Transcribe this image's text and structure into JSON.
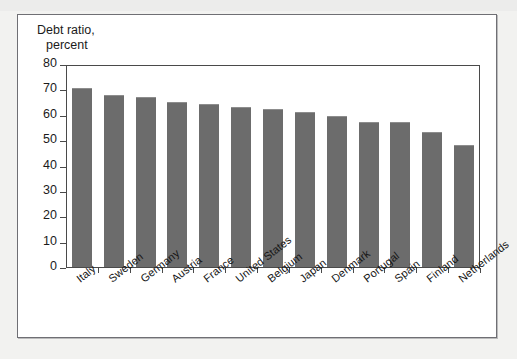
{
  "figure": {
    "title_line1": "Debt ratio,",
    "title_line2": "percent",
    "bar_color": "#6c6c6c",
    "panel_background": "#ffffff",
    "page_background": "#f2f2f0",
    "frame_color": "#6f6f74"
  },
  "chart_data": {
    "type": "bar",
    "title": "Debt ratio, percent",
    "xlabel": "",
    "ylabel": "Debt ratio, percent",
    "ylim": [
      0,
      80
    ],
    "yticks": [
      0,
      10,
      20,
      30,
      40,
      50,
      60,
      70,
      80
    ],
    "ytick_labels": [
      "0",
      "10",
      "20",
      "30",
      "40",
      "50",
      "60",
      "70",
      "80"
    ],
    "grid": false,
    "legend": null,
    "categories": [
      "Italy",
      "Sweden",
      "Germany",
      "Austria",
      "France",
      "United States",
      "Belgium",
      "Japan",
      "Denmark",
      "Portugal",
      "Spain",
      "Finland",
      "Netherlands"
    ],
    "values": [
      71,
      68,
      67.5,
      65.5,
      64.5,
      63.5,
      62.5,
      61.5,
      60,
      57.5,
      57.5,
      53.5,
      48.5
    ]
  }
}
